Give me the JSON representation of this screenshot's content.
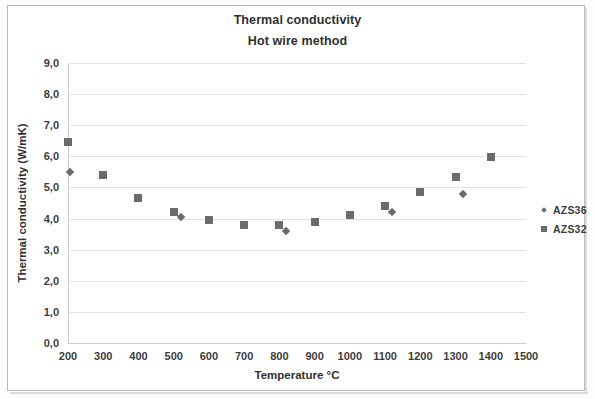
{
  "chart_data": {
    "type": "scatter",
    "title": "Thermal conductivity",
    "subtitle": "Hot wire method",
    "xlabel": "Temperature °C",
    "ylabel": "Thermal conductivity (W/mK)",
    "xlim": [
      200,
      1500
    ],
    "ylim": [
      0.0,
      9.0
    ],
    "xticks": [
      200,
      300,
      400,
      500,
      600,
      700,
      800,
      900,
      1000,
      1100,
      1200,
      1300,
      1400,
      1500
    ],
    "xtick_labels": [
      "200",
      "300",
      "400",
      "500",
      "600",
      "700",
      "800",
      "900",
      "1000",
      "1100",
      "1200",
      "1300",
      "1400",
      "1500"
    ],
    "yticks": [
      0.0,
      1.0,
      2.0,
      3.0,
      4.0,
      5.0,
      6.0,
      7.0,
      8.0,
      9.0
    ],
    "ytick_labels": [
      "0,0",
      "1,0",
      "2,0",
      "3,0",
      "4,0",
      "5,0",
      "6,0",
      "7,0",
      "8,0",
      "9,0"
    ],
    "grid": true,
    "legend_position": "right",
    "decimal_separator": ",",
    "marker_color": "#6b6b6b",
    "series": [
      {
        "name": "AZS36",
        "marker": "diamond",
        "points": [
          {
            "x": 205,
            "y": 5.5
          },
          {
            "x": 520,
            "y": 4.05
          },
          {
            "x": 820,
            "y": 3.6
          },
          {
            "x": 1120,
            "y": 4.2
          },
          {
            "x": 1320,
            "y": 4.8
          }
        ]
      },
      {
        "name": "AZS32",
        "marker": "square",
        "points": [
          {
            "x": 200,
            "y": 6.45
          },
          {
            "x": 300,
            "y": 5.4
          },
          {
            "x": 400,
            "y": 4.65
          },
          {
            "x": 500,
            "y": 4.2
          },
          {
            "x": 600,
            "y": 3.95
          },
          {
            "x": 700,
            "y": 3.78
          },
          {
            "x": 800,
            "y": 3.78
          },
          {
            "x": 900,
            "y": 3.9
          },
          {
            "x": 1000,
            "y": 4.1
          },
          {
            "x": 1100,
            "y": 4.4
          },
          {
            "x": 1200,
            "y": 4.85
          },
          {
            "x": 1300,
            "y": 5.35
          },
          {
            "x": 1400,
            "y": 5.97
          }
        ]
      }
    ]
  },
  "legend": {
    "entries": [
      {
        "label": "AZS36",
        "marker": "diamond"
      },
      {
        "label": "AZS32",
        "marker": "square"
      }
    ]
  }
}
